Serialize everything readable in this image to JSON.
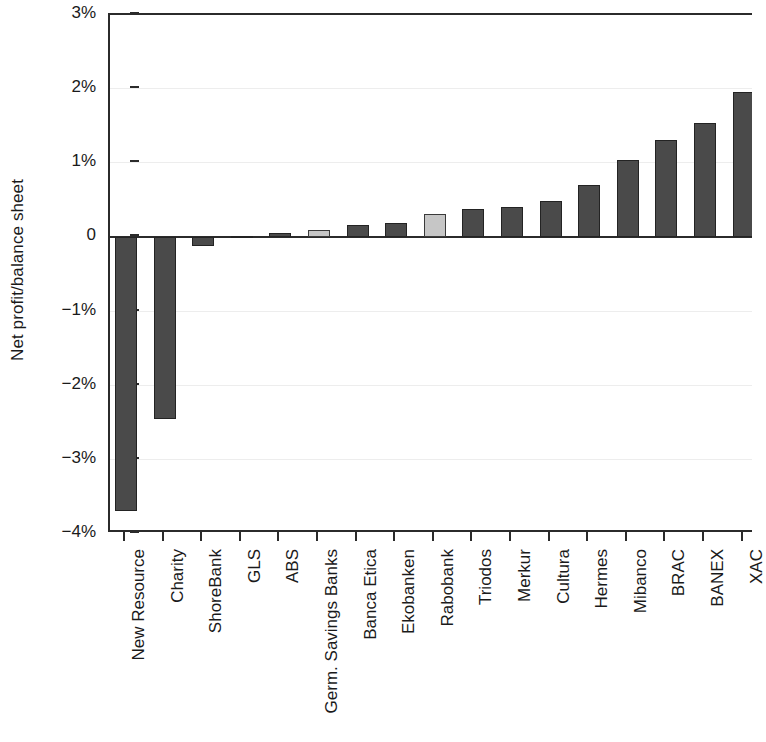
{
  "chart_data": {
    "type": "bar",
    "title": "",
    "xlabel": "",
    "ylabel": "Net profit/balance sheet",
    "ylim": [
      -4,
      3
    ],
    "ytick_labels": [
      "3%",
      "2%",
      "1%",
      "0",
      "−1%",
      "−2%",
      "−3%",
      "−4%"
    ],
    "ytick_values": [
      3,
      2,
      1,
      0,
      -1,
      -2,
      -3,
      -4
    ],
    "grid": true,
    "grid_axis": "y",
    "legend": null,
    "unit": "percent",
    "categories": [
      "New Resource",
      "Charity",
      "ShoreBank",
      "GLS",
      "ABS",
      "Germ. Savings Banks",
      "Banca Etica",
      "Ekobanken",
      "Rabobank",
      "Triodos",
      "Merkur",
      "Cultura",
      "Hermes",
      "Mibanco",
      "BRAC",
      "BANEX",
      "XAC"
    ],
    "values": [
      -3.69,
      -2.45,
      -0.12,
      0.02,
      0.06,
      0.1,
      0.17,
      0.19,
      0.32,
      0.39,
      0.41,
      0.49,
      0.71,
      1.05,
      1.32,
      1.54,
      1.96
    ],
    "highlighted": [
      "Germ. Savings Banks",
      "Rabobank"
    ],
    "colors": {
      "bar": "#4a4a4a",
      "bar_highlight": "#c6c6c6",
      "bar_edge": "#232323",
      "axis": "#2b2b2b",
      "grid": "#ededed",
      "background": "#ffffff"
    }
  }
}
